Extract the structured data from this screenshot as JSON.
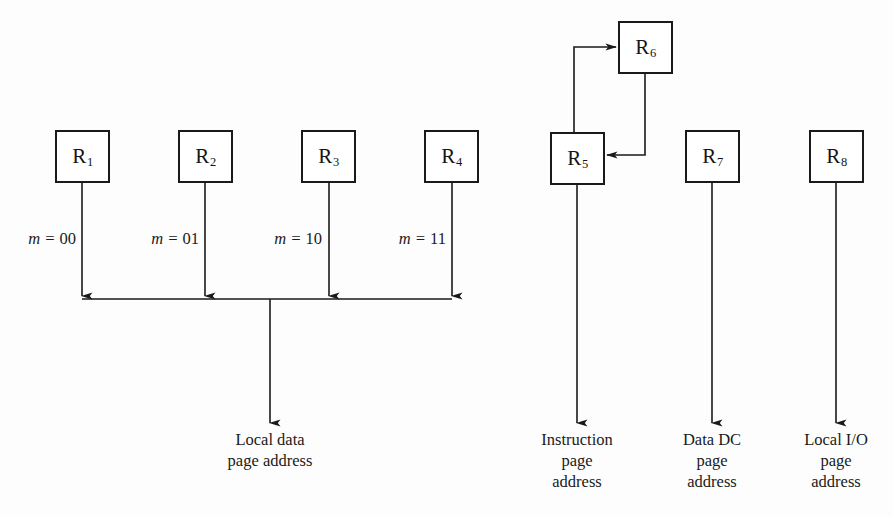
{
  "diagram": {
    "background_color": "#fdfdfd",
    "line_color": "#1a1a1a",
    "registers": [
      {
        "id": "R1",
        "base": "R",
        "sub": "1",
        "x": 55,
        "y": 130,
        "w": 55,
        "h": 53
      },
      {
        "id": "R2",
        "base": "R",
        "sub": "2",
        "x": 178,
        "y": 130,
        "w": 55,
        "h": 53
      },
      {
        "id": "R3",
        "base": "R",
        "sub": "3",
        "x": 301,
        "y": 130,
        "w": 55,
        "h": 53
      },
      {
        "id": "R4",
        "base": "R",
        "sub": "4",
        "x": 424,
        "y": 130,
        "w": 55,
        "h": 53
      },
      {
        "id": "R5",
        "base": "R",
        "sub": "5",
        "x": 550,
        "y": 132,
        "w": 55,
        "h": 53
      },
      {
        "id": "R6",
        "base": "R",
        "sub": "6",
        "x": 618,
        "y": 21,
        "w": 55,
        "h": 53
      },
      {
        "id": "R7",
        "base": "R",
        "sub": "7",
        "x": 685,
        "y": 130,
        "w": 55,
        "h": 53
      },
      {
        "id": "R8",
        "base": "R",
        "sub": "8",
        "x": 809,
        "y": 130,
        "w": 55,
        "h": 53
      }
    ],
    "mode_labels": [
      {
        "var": "m",
        "eq": " = ",
        "value": "00",
        "x": 76,
        "y": 229
      },
      {
        "var": "m",
        "eq": " = ",
        "value": "01",
        "x": 199,
        "y": 229
      },
      {
        "var": "m",
        "eq": " = ",
        "value": "10",
        "x": 322,
        "y": 229
      },
      {
        "var": "m",
        "eq": " = ",
        "value": "11",
        "x": 446,
        "y": 229
      }
    ],
    "output_labels": [
      {
        "name": "local-data-page-address",
        "lines": [
          "Local data",
          "page address"
        ],
        "x": 270,
        "y": 429
      },
      {
        "name": "instruction-page-address",
        "lines": [
          "Instruction",
          "page",
          "address"
        ],
        "x": 577,
        "y": 429
      },
      {
        "name": "data-dc-page-address",
        "lines": [
          "Data DC",
          "page",
          "address"
        ],
        "x": 712,
        "y": 429
      },
      {
        "name": "local-io-page-address",
        "lines": [
          "Local I/O",
          "page",
          "address"
        ],
        "x": 836,
        "y": 429
      }
    ],
    "bus": {
      "y": 299,
      "x_start": 82,
      "x_end": 452,
      "drop_x": 270,
      "drop_end_y": 423
    },
    "connections": [
      {
        "name": "r1-to-bus",
        "from": "R1",
        "to": "bus",
        "x": 82,
        "y1": 183,
        "y2": 296
      },
      {
        "name": "r2-to-bus",
        "from": "R2",
        "to": "bus",
        "x": 205,
        "y1": 183,
        "y2": 296
      },
      {
        "name": "r3-to-bus",
        "from": "R3",
        "to": "bus",
        "x": 329,
        "y1": 183,
        "y2": 296
      },
      {
        "name": "r4-to-bus",
        "from": "R4",
        "to": "bus",
        "x": 452,
        "y1": 183,
        "y2": 296
      },
      {
        "name": "r5-output",
        "from": "R5",
        "to": "instruction-page-address",
        "x": 577,
        "y1": 185,
        "y2": 423
      },
      {
        "name": "r7-output",
        "from": "R7",
        "to": "data-dc-page-address",
        "x": 712,
        "y1": 183,
        "y2": 423
      },
      {
        "name": "r8-output",
        "from": "R8",
        "to": "local-io-page-address",
        "x": 836,
        "y1": 183,
        "y2": 423
      },
      {
        "name": "r5-to-r6-feedback",
        "from": "R5",
        "to": "R6",
        "riser_x": 574,
        "top_y": 47,
        "arrow_x": 618
      },
      {
        "name": "r6-to-r5-feedback",
        "from": "R6",
        "to": "R5",
        "riser_x": 645,
        "bottom_y": 155,
        "arrow_x": 605
      }
    ]
  }
}
